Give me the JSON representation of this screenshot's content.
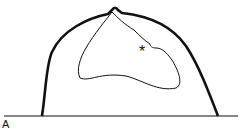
{
  "diagram": {
    "panel_label": "A",
    "marker": "*",
    "colors": {
      "stroke": "#111111",
      "background": "#ffffff"
    }
  }
}
